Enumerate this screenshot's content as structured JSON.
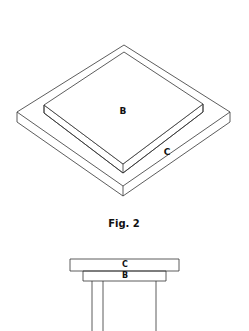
{
  "figure": {
    "caption": "Fig. 2",
    "line_color": "#333333",
    "background": "#ffffff"
  },
  "isometric_view": {
    "outer_plate": {
      "label": "C",
      "top_face": [
        [
          124,
          45
        ],
        [
          230,
          112
        ],
        [
          123,
          186
        ],
        [
          17,
          112
        ]
      ],
      "thickness": 10
    },
    "inner_plate": {
      "label": "B",
      "top_face": [
        [
          124,
          52
        ],
        [
          203,
          104
        ],
        [
          123,
          164
        ],
        [
          44,
          105
        ]
      ],
      "thickness": 8
    }
  },
  "side_view": {
    "top_slab": {
      "label": "C",
      "x": 70,
      "y": 259,
      "w": 109,
      "h": 12
    },
    "middle_slab": {
      "label": "B",
      "x": 83,
      "y": 271,
      "w": 83,
      "h": 10
    },
    "legs_x": [
      92,
      103,
      156
    ]
  }
}
